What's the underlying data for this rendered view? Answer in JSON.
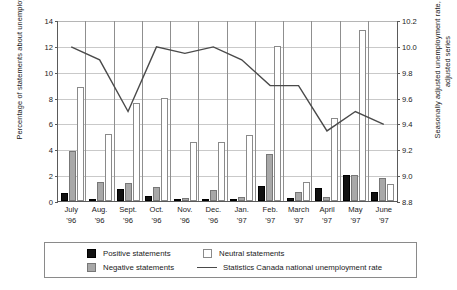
{
  "chart_data": {
    "type": "bar",
    "title": "",
    "subtitle": "",
    "categories": [
      "July '96",
      "Aug. '96",
      "Sept. '96",
      "Oct. '96",
      "Nov. '96",
      "Dec. '96",
      "Jan. '97",
      "Feb. '97",
      "March '97",
      "April '97",
      "May '97",
      "June '97"
    ],
    "category_lines": [
      [
        "July",
        "'96"
      ],
      [
        "Aug.",
        "'96"
      ],
      [
        "Sept.",
        "'96"
      ],
      [
        "Oct.",
        "'96"
      ],
      [
        "Nov.",
        "'96"
      ],
      [
        "Dec.",
        "'96"
      ],
      [
        "Jan.",
        "'97"
      ],
      [
        "Feb.",
        "'97"
      ],
      [
        "March",
        "'97"
      ],
      [
        "April",
        "'97"
      ],
      [
        "May",
        "'97"
      ],
      [
        "June",
        "'97"
      ]
    ],
    "xlabel": "",
    "ylabel": "Percentage of statements about unemployment",
    "ylabel_right": "Seasonally adjusted unemployment rate, time adjusted series",
    "ylim": [
      0,
      14
    ],
    "yticks": [
      0,
      2,
      4,
      6,
      8,
      10,
      12,
      14
    ],
    "ytick_labels": [
      "0",
      "2",
      "4",
      "6",
      "8",
      "10",
      "12",
      "14"
    ],
    "ylim_right": [
      8.8,
      10.2
    ],
    "yticks_right": [
      8.8,
      9.0,
      9.2,
      9.4,
      9.6,
      9.8,
      10.0,
      10.2
    ],
    "ytick_labels_right": [
      "8.8",
      "9.0",
      "9.2",
      "9.4",
      "9.6",
      "9.8",
      "10.0",
      "10.2"
    ],
    "grid": true,
    "legend_position": "bottom",
    "series": [
      {
        "name": "Positive statements",
        "kind": "bar",
        "color": "#111111",
        "axis": "left",
        "values": [
          0.6,
          0.1,
          0.9,
          0.35,
          0.0,
          0.15,
          0.0,
          1.2,
          0.2,
          1.0,
          2.0,
          0.7
        ]
      },
      {
        "name": "Negative statements",
        "kind": "bar",
        "color": "#a8a8a8",
        "axis": "left",
        "values": [
          3.9,
          1.45,
          1.4,
          1.05,
          0.2,
          0.85,
          0.3,
          3.6,
          0.7,
          0.3,
          2.05,
          1.75
        ]
      },
      {
        "name": "Neutral statements",
        "kind": "bar",
        "color": "#ffffff",
        "axis": "left",
        "values": [
          8.8,
          5.2,
          7.6,
          8.0,
          4.55,
          4.55,
          5.1,
          12.0,
          1.5,
          6.4,
          13.2,
          1.3
        ]
      },
      {
        "name": "Statistics Canada national unemployment rate",
        "kind": "line",
        "color": "#4a4a4a",
        "axis": "right",
        "values_right": [
          10.0,
          9.9,
          9.3,
          10.0,
          9.95,
          10.0,
          9.85,
          9.7,
          9.7,
          9.35,
          9.5,
          9.4
        ],
        "values_left_scale": [
          12.0,
          11.0,
          7.0,
          12.0,
          11.5,
          12.0,
          11.0,
          9.0,
          9.0,
          5.5,
          7.0,
          6.0
        ]
      }
    ]
  },
  "legend": {
    "items": [
      {
        "label": "Positive statements",
        "marker": "swatch-black"
      },
      {
        "label": "Neutral statements",
        "marker": "swatch-white"
      },
      {
        "label": "Negative statements",
        "marker": "swatch-gray"
      },
      {
        "label": "Statistics Canada national unemployment rate",
        "marker": "line-gray"
      }
    ]
  }
}
